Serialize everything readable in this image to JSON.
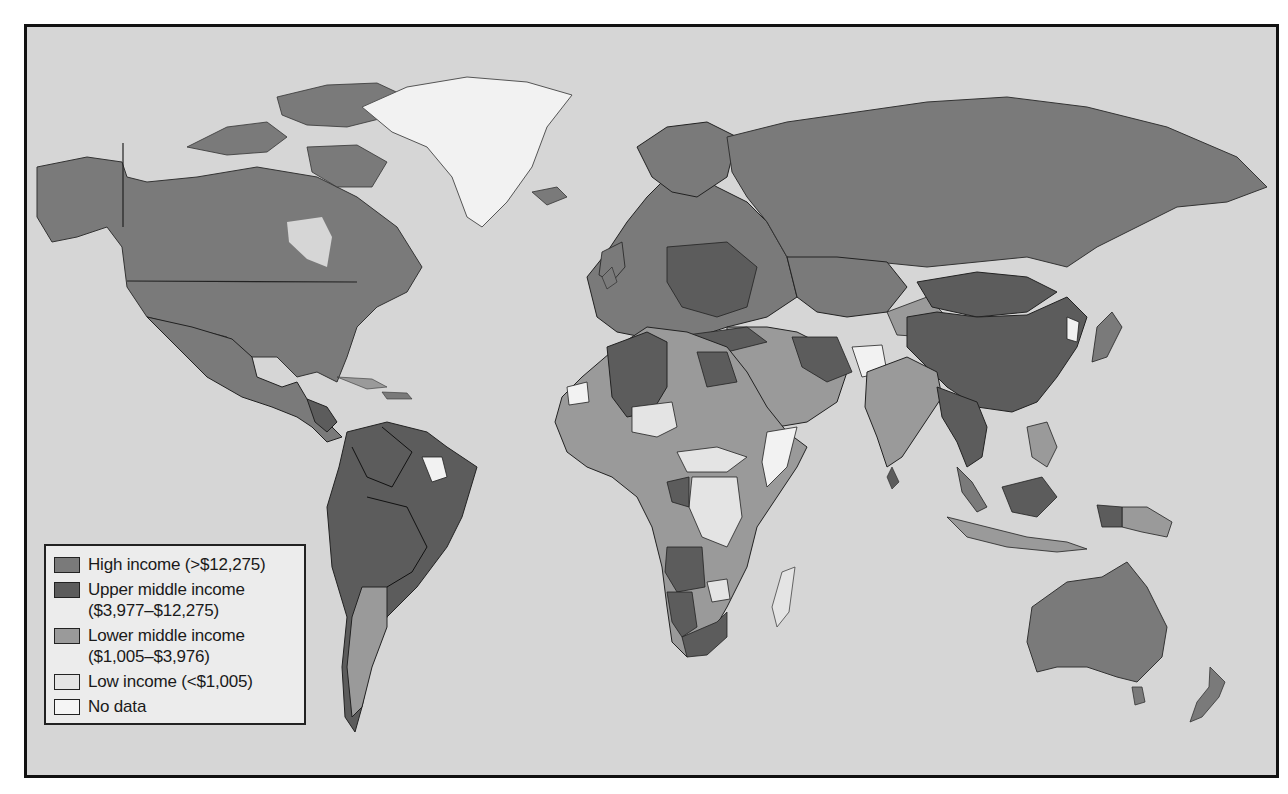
{
  "map": {
    "title": "World income groups",
    "colors": {
      "ocean": "#d6d6d6",
      "high_income": "#7a7a7a",
      "upper_middle_income": "#5c5c5c",
      "lower_middle_income": "#9a9a9a",
      "low_income": "#e4e4e4",
      "no_data": "#f2f2f2",
      "border": "#222222"
    }
  },
  "legend": {
    "items": [
      {
        "label_line1": "High income (>$12,275)",
        "label_line2": "",
        "color": "#7a7a7a",
        "key": "high_income"
      },
      {
        "label_line1": "Upper middle income",
        "label_line2": "($3,977–$12,275)",
        "color": "#5c5c5c",
        "key": "upper_middle_income"
      },
      {
        "label_line1": "Lower middle income",
        "label_line2": "($1,005–$3,976)",
        "color": "#9a9a9a",
        "key": "lower_middle_income"
      },
      {
        "label_line1": "Low income (<$1,005)",
        "label_line2": "",
        "color": "#e4e4e4",
        "key": "low_income"
      },
      {
        "label_line1": "No data",
        "label_line2": "",
        "color": "#f5f5f5",
        "key": "no_data"
      }
    ]
  }
}
